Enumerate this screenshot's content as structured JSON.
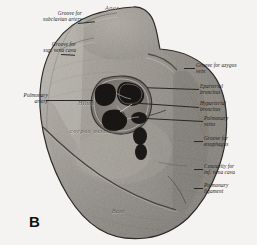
{
  "figure": {
    "panel_marker": "B",
    "background_color": "#f4f3f1",
    "ink_color": "#1d1b18"
  },
  "in_image_labels": [
    {
      "name": "apex",
      "text": "Apex"
    },
    {
      "name": "hilum",
      "text": "Hilum"
    },
    {
      "name": "corpus-vertebrae",
      "text": "corpus osseum"
    },
    {
      "name": "base",
      "text": "Base"
    }
  ],
  "callouts_left": [
    {
      "name": "groove-subclavian-artery",
      "text": "Groove for\nsubclavian artery"
    },
    {
      "name": "groove-sup-vena-cava",
      "text": "Groove for\nsup. vena cava"
    },
    {
      "name": "pulmonary-artery",
      "text": "Pulmonary\nartery"
    }
  ],
  "callouts_right": [
    {
      "name": "groove-azygos-vein",
      "text": "Groove for azygos\nvein"
    },
    {
      "name": "eparterial-bronchus",
      "text": "Eparterial\nbronchus"
    },
    {
      "name": "hyparterial-bronchus",
      "text": "Hyparterial\nbronchus"
    },
    {
      "name": "pulmonary-veins",
      "text": "Pulmonary\nveins"
    },
    {
      "name": "groove-oesophagus",
      "text": "Groove for\nœsophagus"
    },
    {
      "name": "concavity-inf-vena-cava",
      "text": "Concavity for\ninf. vena cava"
    },
    {
      "name": "pulmonary-ligament",
      "text": "Pulmonary\nligament"
    }
  ]
}
